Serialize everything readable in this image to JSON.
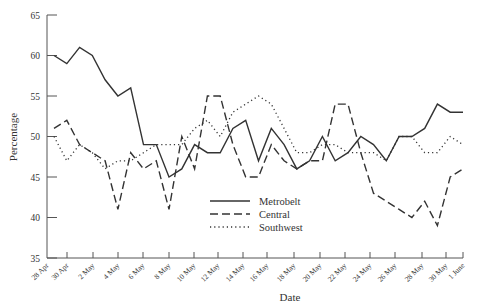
{
  "chart_data": {
    "type": "line",
    "title": "",
    "xlabel": "Date",
    "ylabel": "Percentage",
    "ylim": [
      35,
      65
    ],
    "yticks": [
      35,
      40,
      45,
      50,
      55,
      60,
      65
    ],
    "xtick_labels": [
      "28 Apr",
      "30 Apr",
      "2 May",
      "4 May",
      "6 May",
      "8 May",
      "10 May",
      "12 May",
      "14 May",
      "16 May",
      "18 May",
      "20 May",
      "22 May",
      "24 May",
      "26 May",
      "28 May",
      "30 May",
      "1 June"
    ],
    "grid": false,
    "legend_position": "lower-center-right",
    "series": [
      {
        "name": "Metrobelt",
        "style": "solid",
        "values": [
          60,
          59,
          61,
          60,
          57,
          55,
          56,
          49,
          49,
          45,
          46,
          49,
          48,
          48,
          51,
          52,
          47,
          51,
          49,
          46,
          47,
          50,
          47,
          48,
          50,
          49,
          47,
          50,
          50,
          51,
          54,
          53,
          53
        ]
      },
      {
        "name": "Central",
        "style": "dashed",
        "values": [
          51,
          52,
          49,
          48,
          47,
          41,
          48,
          46,
          47,
          41,
          50,
          46,
          55,
          55,
          49,
          45,
          45,
          49,
          47,
          46,
          47,
          47,
          54,
          54,
          48,
          43,
          42,
          41,
          40,
          42,
          39,
          45,
          46
        ]
      },
      {
        "name": "Southwest",
        "style": "dotted",
        "values": [
          50,
          47,
          49,
          48,
          46,
          47,
          47,
          48,
          49,
          49,
          49,
          51,
          52,
          50,
          53,
          54,
          55,
          54,
          51,
          48,
          48,
          49,
          49,
          48,
          48,
          48,
          47,
          50,
          50,
          48,
          48,
          50,
          49
        ]
      }
    ]
  },
  "colors": {
    "line": "#333333",
    "axis": "#555555"
  }
}
